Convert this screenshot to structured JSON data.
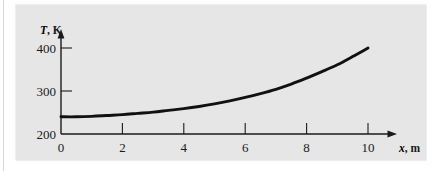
{
  "figure": {
    "background_color": "#e6e6e6",
    "page_color": "#ffffff",
    "curve_color": "#111111",
    "axis_color": "#1a1a1a"
  },
  "chart_data": {
    "type": "line",
    "title": "",
    "subtitle": "",
    "xlabel_var": "x",
    "xlabel_unit": ", m",
    "ylabel_var": "T",
    "ylabel_unit": ", K",
    "xlim": [
      0,
      10.6
    ],
    "ylim": [
      200,
      415
    ],
    "xticks": [
      0,
      2,
      4,
      6,
      8,
      10
    ],
    "xtick_labels": [
      "0",
      "2",
      "4",
      "6",
      "8",
      "10"
    ],
    "yticks": [
      200,
      300,
      400
    ],
    "ytick_labels": [
      "200",
      "300",
      "400"
    ],
    "grid": false,
    "legend": null,
    "series": [
      {
        "name": "T(x)",
        "x": [
          0,
          0.5,
          1,
          1.5,
          2,
          2.5,
          3,
          3.5,
          4,
          4.5,
          5,
          5.5,
          6,
          6.5,
          7,
          7.5,
          8,
          8.5,
          9,
          9.5,
          10
        ],
        "y": [
          240,
          240,
          241,
          243,
          245,
          248,
          251,
          255,
          259,
          264,
          270,
          277,
          285,
          294,
          304,
          316,
          330,
          345,
          361,
          380,
          400
        ]
      }
    ],
    "annotations": []
  }
}
